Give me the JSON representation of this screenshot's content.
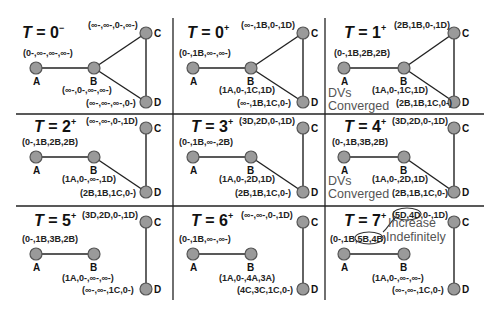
{
  "colors": {
    "node_fill": "#9a9a9a",
    "node_stroke": "#555555",
    "line": "#222222",
    "note_text": "#555555"
  },
  "panels": [
    {
      "title_var": "T",
      "title_eq": " = 0",
      "title_sup": "−",
      "edges": [
        "A-B",
        "B-C",
        "B-D",
        "C-D"
      ],
      "dv": {
        "A": "(0-,∞-,∞-,∞-)",
        "B": "(∞-,0-,∞-,∞-)",
        "C": "(∞-,∞-,0-,∞-)",
        "D": "(∞-,∞-,∞-,0-)"
      },
      "note": ""
    },
    {
      "title_var": "T",
      "title_eq": " = 0",
      "title_sup": "+",
      "edges": [
        "A-B",
        "B-C",
        "B-D",
        "C-D"
      ],
      "dv": {
        "A": "(0-,1B,∞-,∞-)",
        "B": "(1A,0-,1C,1D)",
        "C": "(∞-,1B,0-,1D)",
        "D": "(∞-,1B,1C,0-)"
      },
      "note": ""
    },
    {
      "title_var": "T",
      "title_eq": " = 1",
      "title_sup": "+",
      "edges": [
        "A-B",
        "B-C",
        "B-D",
        "C-D"
      ],
      "dv": {
        "A": "(0-,1B,2B,2B)",
        "B": "(1A,0-,1C,1D)",
        "C": "(2B,1B,0-,1D)",
        "D": "(2B,1B,1C,0-)"
      },
      "note": "DVs Converged"
    },
    {
      "title_var": "T",
      "title_eq": " = 2",
      "title_sup": "+",
      "edges": [
        "A-B",
        "B-D",
        "C-D"
      ],
      "dv": {
        "A": "(0-,1B,2B,2B)",
        "B": "(1A,0-,∞-,1D)",
        "C": "(∞-,∞-,0-,1D)",
        "D": "(2B,1B,1C,0-)"
      },
      "note": ""
    },
    {
      "title_var": "T",
      "title_eq": " = 3",
      "title_sup": "+",
      "edges": [
        "A-B",
        "B-D",
        "C-D"
      ],
      "dv": {
        "A": "(0-,1B,∞-,2B)",
        "B": "(1A,0-,2D,1D)",
        "C": "(3D,2D,0-,1D)",
        "D": "(2B,1B,1C,0-)"
      },
      "note": ""
    },
    {
      "title_var": "T",
      "title_eq": " = 4",
      "title_sup": "+",
      "edges": [
        "A-B",
        "B-D",
        "C-D"
      ],
      "dv": {
        "A": "(0-,1B,3B,2B)",
        "B": "(1A,0-,2D,1D)",
        "C": "(3D,2D,0-,1D)",
        "D": "(2B,1B,1C,0-)"
      },
      "note": "DVs Converged"
    },
    {
      "title_var": "T",
      "title_eq": " = 5",
      "title_sup": "+",
      "edges": [
        "A-B",
        "C-D"
      ],
      "dv": {
        "A": "(0-,1B,3B,2B)",
        "B": "(1A,0-,∞-,∞-)",
        "C": "(3D,2D,0-,1D)",
        "D": "(∞-,∞-,1C,0-)"
      },
      "note": ""
    },
    {
      "title_var": "T",
      "title_eq": " = 6",
      "title_sup": "+",
      "edges": [
        "A-B",
        "C-D"
      ],
      "dv": {
        "A": "(0-,1B,∞-,∞-)",
        "B": "(1A,0-,4A,3A)",
        "C": "(∞-,∞-,0-,1D)",
        "D": "(4C,3C,1C,0-)"
      },
      "note": ""
    },
    {
      "title_var": "T",
      "title_eq": " = 7",
      "title_sup": "+",
      "edges": [
        "A-B",
        "C-D"
      ],
      "dv": {
        "A": "(0-,1B,5B,4B)",
        "B": "(1A,0-,∞-,∞-)",
        "C": "(5D,4D,0-,1D)",
        "D": "(∞-,∞-,1C,0-)"
      },
      "note": "Increase Indefinitely",
      "note_lines": [
        "Increase",
        "Indefinitely"
      ],
      "highlighted": {
        "A": "5B,4B",
        "C": "5D,4D"
      }
    }
  ],
  "node_names": {
    "A": "A",
    "B": "B",
    "C": "C",
    "D": "D"
  },
  "notes": {
    "converged_line1": "DVs",
    "converged_line2": "Converged"
  }
}
